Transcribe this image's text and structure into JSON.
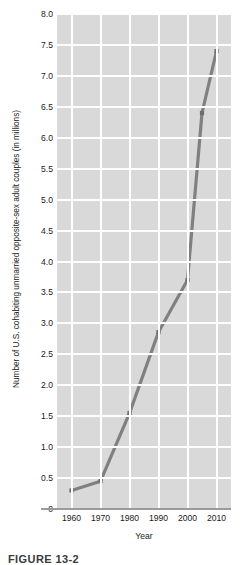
{
  "chart_data": {
    "type": "line",
    "title": "",
    "xlabel": "Year",
    "ylabel": "Number of U.S. cohabiting unmarried opposite-sex adult couples (in millions)",
    "x": [
      1960,
      1970,
      1980,
      1990,
      2000,
      2005,
      2010
    ],
    "values": [
      0.3,
      0.45,
      1.55,
      2.86,
      3.7,
      6.4,
      7.4
    ],
    "xlim": [
      1955,
      2015
    ],
    "ylim": [
      0,
      8.0
    ],
    "xticks": [
      1960,
      1970,
      1980,
      1990,
      2000,
      2010
    ],
    "xtick_labels": [
      "1960",
      "1970",
      "1980",
      "1990",
      "2000",
      "2010"
    ],
    "yticks": [
      0,
      0.5,
      1.0,
      1.5,
      2.0,
      2.5,
      3.0,
      3.5,
      4.0,
      4.5,
      5.0,
      5.5,
      6.0,
      6.5,
      7.0,
      7.5,
      8.0
    ],
    "ytick_labels": [
      "0",
      "0.5",
      "1.0",
      "1.5",
      "2.0",
      "2.5",
      "3.0",
      "3.5",
      "4.0",
      "4.5",
      "5.0",
      "5.5",
      "6.0",
      "6.5",
      "7.0",
      "7.5",
      "8.0"
    ],
    "grid": true,
    "legend": false,
    "marker": "square",
    "line_color": "#808080",
    "marker_color": "#6e6e6e",
    "plot_background": "#d9d9d9",
    "gridline_color": "#ffffff",
    "axis_color": "#9a9a9a"
  },
  "caption": {
    "text": "FIGURE 13-2"
  }
}
